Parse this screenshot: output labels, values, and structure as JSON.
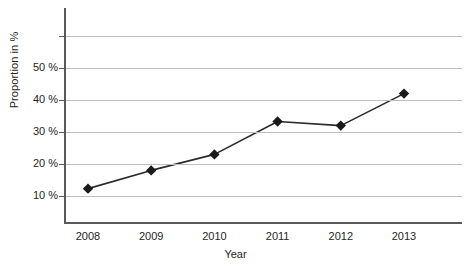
{
  "chart_data": {
    "type": "line",
    "title": "",
    "subtitle": "",
    "xlabel": "Year",
    "ylabel": "Proportion in %",
    "categories": [
      "2008",
      "2009",
      "2010",
      "2011",
      "2012",
      "2013"
    ],
    "values": [
      12.3,
      18,
      23,
      33.3,
      32,
      42
    ],
    "series": [
      {
        "name": "Proportion",
        "values": [
          12.3,
          18,
          23,
          33.3,
          32,
          42
        ]
      }
    ],
    "x_tick_labels": [
      "2008",
      "2009",
      "2010",
      "2011",
      "2012",
      "2013"
    ],
    "y_tick_labels": [
      "10 %",
      "20 %",
      "30 %",
      "40 %",
      "50 %"
    ],
    "y_tick_values": [
      10,
      20,
      30,
      40,
      50
    ],
    "gridline_values": [
      10,
      20,
      30,
      40,
      50,
      60
    ],
    "ylim": [
      0,
      62
    ],
    "xlim": [
      2007.5,
      2013.9
    ],
    "grid": "horizontal",
    "legend": "none",
    "marker": "diamond",
    "annotations": [],
    "colors": {
      "line": "#2b2b2b",
      "marker": "#1a1a1a",
      "gridline": "#bcbec0",
      "axis": "#58595b",
      "text": "#231f20",
      "background": "#ffffff"
    }
  }
}
